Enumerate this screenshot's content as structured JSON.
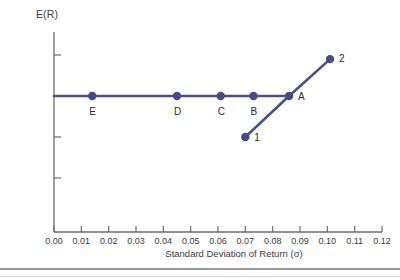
{
  "chart_data": {
    "type": "line",
    "title": "",
    "xlabel": "Standard Deviation of Return (σ)",
    "ylabel": "E(R)",
    "xlim": [
      0.0,
      0.12
    ],
    "ylim": [
      0.0,
      0.215
    ],
    "grid": false,
    "legend": "none",
    "xticks": [
      "0.00",
      "0.01",
      "0.02",
      "0.03",
      "0.04",
      "0.05",
      "0.06",
      "0.07",
      "0.08",
      "0.09",
      "0.10",
      "0.11",
      "0.12"
    ],
    "xtick_values": [
      0.0,
      0.01,
      0.02,
      0.03,
      0.04,
      0.05,
      0.06,
      0.07,
      0.08,
      0.09,
      0.1,
      0.11,
      0.12
    ],
    "yticks": [
      "0.05",
      "0.10",
      "0.15",
      "0.20"
    ],
    "ytick_values": [
      0.05,
      0.1,
      0.15,
      0.2
    ],
    "series": [
      {
        "name": "efficient-frontier-flat",
        "points": [
          {
            "x": 0.0,
            "y": 0.15,
            "label": "",
            "marker": false
          },
          {
            "x": 0.014,
            "y": 0.15,
            "label": "E",
            "marker": true
          },
          {
            "x": 0.045,
            "y": 0.15,
            "label": "D",
            "marker": true
          },
          {
            "x": 0.061,
            "y": 0.15,
            "label": "C",
            "marker": true
          },
          {
            "x": 0.073,
            "y": 0.15,
            "label": "B",
            "marker": true
          },
          {
            "x": 0.086,
            "y": 0.15,
            "label": "A",
            "marker": true
          }
        ]
      },
      {
        "name": "risky-asset-line",
        "points": [
          {
            "x": 0.07,
            "y": 0.1,
            "label": "1",
            "marker": true
          },
          {
            "x": 0.086,
            "y": 0.15,
            "label": "",
            "marker": false
          },
          {
            "x": 0.101,
            "y": 0.195,
            "label": "2",
            "marker": true
          }
        ]
      }
    ]
  },
  "colors": {
    "line": "#4c4f8a",
    "marker": "#464a86",
    "axis": "#6d6d6d",
    "text": "#3b3b3b",
    "rule": "#9a9a9a"
  }
}
